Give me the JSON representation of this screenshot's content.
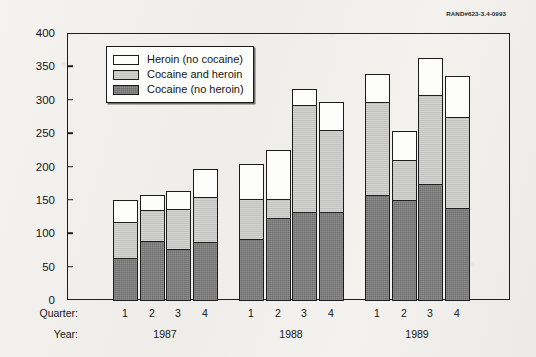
{
  "catalog_number": "RAND#623-3.4-0993",
  "axes": {
    "y_title": "Total episodes",
    "y_ticks": [
      "0",
      "50",
      "100",
      "150",
      "200",
      "250",
      "300",
      "350",
      "400"
    ],
    "quarter_row_title": "Quarter:",
    "year_row_title": "Year:"
  },
  "legend": {
    "items": [
      {
        "label": "Heroin (no cocaine)",
        "color": "#fdfdfb",
        "key": "heroin_no_cocaine"
      },
      {
        "label": "Cocaine and heroin",
        "color": "#c2c2c0",
        "key": "cocaine_and_heroin"
      },
      {
        "label": "Cocaine (no heroin)",
        "color": "#6e6e6e",
        "key": "cocaine_no_heroin"
      }
    ]
  },
  "chart_data": {
    "type": "bar",
    "subtype": "stacked",
    "title": "",
    "xlabel": "Quarter / Year",
    "ylabel": "Total episodes",
    "ylim": [
      0,
      400
    ],
    "ytick_step": 50,
    "grid": false,
    "legend_position": "top-left-inside",
    "categories": [
      "1987 Q1",
      "1987 Q2",
      "1987 Q3",
      "1987 Q4",
      "1988 Q1",
      "1988 Q2",
      "1988 Q3",
      "1988 Q4",
      "1989 Q1",
      "1989 Q2",
      "1989 Q3",
      "1989 Q4"
    ],
    "quarters": [
      "1",
      "2",
      "3",
      "4",
      "1",
      "2",
      "3",
      "4",
      "1",
      "2",
      "3",
      "4"
    ],
    "years": [
      "1987",
      "1988",
      "1989"
    ],
    "series": [
      {
        "name": "Cocaine (no heroin)",
        "color": "#6e6e6e",
        "values": [
          65,
          90,
          78,
          88,
          93,
          125,
          133,
          133,
          159,
          152,
          175,
          140
        ]
      },
      {
        "name": "Cocaine and heroin",
        "color": "#c2c2c0",
        "values": [
          55,
          48,
          62,
          70,
          62,
          30,
          162,
          125,
          141,
          61,
          135,
          137
        ]
      },
      {
        "name": "Heroin (no cocaine)",
        "color": "#fdfdfb",
        "values": [
          35,
          25,
          28,
          43,
          53,
          74,
          26,
          44,
          43,
          45,
          57,
          63
        ]
      }
    ],
    "cumulative_tops": {
      "cocaine_no_heroin": [
        65,
        90,
        78,
        88,
        93,
        125,
        133,
        133,
        159,
        152,
        175,
        140
      ],
      "cocaine_and_heroin": [
        120,
        138,
        140,
        158,
        155,
        155,
        295,
        258,
        300,
        213,
        310,
        277
      ],
      "total": [
        155,
        163,
        168,
        201,
        208,
        229,
        321,
        302,
        343,
        258,
        367,
        340
      ]
    }
  }
}
